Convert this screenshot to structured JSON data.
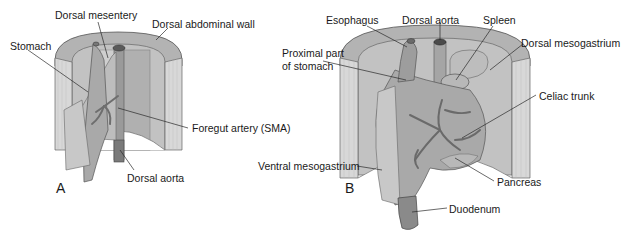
{
  "figure": {
    "panels": [
      {
        "id": "A",
        "letter": "A",
        "labels": {
          "dorsal_mesentery": "Dorsal mesentery",
          "dorsal_abdominal_wall": "Dorsal abdominal wall",
          "stomach": "Stomach",
          "foregut_artery": "Foregut artery (SMA)",
          "dorsal_aorta": "Dorsal aorta"
        }
      },
      {
        "id": "B",
        "letter": "B",
        "labels": {
          "esophagus": "Esophagus",
          "dorsal_aorta": "Dorsal aorta",
          "spleen": "Spleen",
          "proximal_stomach_line1": "Proximal part",
          "proximal_stomach_line2": "of stomach",
          "dorsal_mesogastrium": "Dorsal mesogastrium",
          "celiac_trunk": "Celiac trunk",
          "ventral_mesogastrium": "Ventral mesogastrium",
          "pancreas": "Pancreas",
          "duodenum": "Duodenum"
        }
      }
    ],
    "colors": {
      "wall_top": "#b5b5b5",
      "wall_side": "#d6d6d6",
      "wall_inner": "#c4c4c4",
      "organ": "#a8a8a8",
      "organ_light": "#c9c9c9",
      "vessel": "#6e6e6e",
      "leader": "#2a2a2a"
    }
  }
}
